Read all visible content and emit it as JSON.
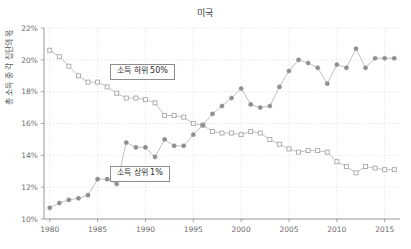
{
  "chart_data": {
    "type": "line",
    "title": "미국",
    "xlabel": "",
    "ylabel": "총 소득 중 각 집단의 몫",
    "xlim": [
      1979.4,
      2016.6
    ],
    "ylim": [
      10,
      22
    ],
    "xticks": [
      1980,
      1985,
      1990,
      1995,
      2000,
      2005,
      2010,
      2015
    ],
    "xticklabels": [
      "1980",
      "1985",
      "1990",
      "1995",
      "2000",
      "2005",
      "2010",
      "2015"
    ],
    "yticks": [
      10,
      12,
      14,
      16,
      18,
      20,
      22
    ],
    "yticklabels": [
      "10%",
      "12%",
      "14%",
      "16%",
      "18%",
      "20%",
      "22%"
    ],
    "grid": true,
    "legend_position": "inline-annotations",
    "x": [
      1980,
      1981,
      1982,
      1983,
      1984,
      1985,
      1986,
      1987,
      1988,
      1989,
      1990,
      1991,
      1992,
      1993,
      1994,
      1995,
      1996,
      1997,
      1998,
      1999,
      2000,
      2001,
      2002,
      2003,
      2004,
      2005,
      2006,
      2007,
      2008,
      2009,
      2010,
      2011,
      2012,
      2013,
      2014,
      2015,
      2016
    ],
    "series": [
      {
        "name": "소득 하위 50%",
        "marker": "open-square",
        "color": "#a8a8a8",
        "values": [
          20.6,
          20.2,
          19.6,
          19.0,
          18.6,
          18.6,
          18.3,
          17.9,
          17.6,
          17.6,
          17.5,
          17.3,
          16.5,
          16.5,
          16.4,
          16.0,
          15.9,
          15.5,
          15.4,
          15.4,
          15.3,
          15.5,
          15.4,
          15.0,
          14.7,
          14.4,
          14.2,
          14.3,
          14.3,
          14.2,
          13.6,
          13.3,
          12.9,
          13.3,
          13.2,
          13.1,
          13.1
        ]
      },
      {
        "name": "소득 상위 1%",
        "marker": "filled-circle",
        "color": "#8e8e8e",
        "values": [
          10.7,
          11.0,
          11.2,
          11.3,
          11.5,
          12.5,
          12.5,
          12.2,
          14.8,
          14.5,
          14.5,
          13.9,
          15.0,
          14.6,
          14.6,
          15.3,
          15.9,
          16.6,
          17.1,
          17.6,
          18.2,
          17.2,
          17.0,
          17.1,
          18.3,
          19.3,
          20.0,
          19.8,
          19.5,
          18.5,
          19.7,
          19.5,
          20.7,
          19.5,
          20.1,
          20.1,
          20.1
        ]
      }
    ],
    "annotations": [
      {
        "text": "소득 하위 50%",
        "series": "bottom50"
      },
      {
        "text": "소득 상위 1%",
        "series": "top1"
      }
    ]
  },
  "corner": {
    "mark": ""
  }
}
